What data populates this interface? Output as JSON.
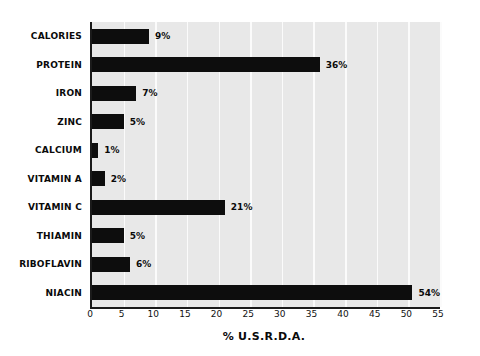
{
  "chart_data": {
    "type": "bar",
    "orientation": "horizontal",
    "title": "",
    "xlabel": "% U.S.R.D.A.",
    "ylabel": "",
    "categories": [
      "CALORIES",
      "PROTEIN",
      "IRON",
      "ZINC",
      "CALCIUM",
      "VITAMIN A",
      "VITAMIN C",
      "THIAMIN",
      "RIBOFLAVIN",
      "NIACIN"
    ],
    "values": [
      9,
      36,
      7,
      5,
      1,
      2,
      21,
      5,
      6,
      54
    ],
    "value_labels": [
      "9%",
      "36%",
      "7%",
      "5%",
      "1%",
      "2%",
      "21%",
      "5%",
      "6%",
      "54%"
    ],
    "xlim": [
      0,
      55
    ],
    "xticks": [
      0,
      5,
      10,
      15,
      20,
      25,
      30,
      35,
      40,
      45,
      50,
      55
    ],
    "xtick_labels": [
      "0",
      "5",
      "10",
      "15",
      "20",
      "25",
      "30",
      "35",
      "40",
      "45",
      "50",
      "55"
    ],
    "grid": true,
    "grid_axis": "x",
    "legend": null,
    "colors": {
      "bar": "#0d0d0d",
      "plot_background": "#e8e8e8",
      "gridline": "#fbfbfb",
      "axis_line": "#1a1a1a",
      "text": "#0a0a0a",
      "figure_background": "#ffffff"
    }
  }
}
